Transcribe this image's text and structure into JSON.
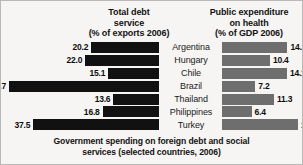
{
  "chart_data": {
    "type": "bar",
    "title": "Government spending on foreign debt and social services (selected countries, 2006)",
    "orientation": "horizontal",
    "layout": "diverging-paired",
    "grid": false,
    "legend": "none",
    "categories": [
      "Argentina",
      "Hungary",
      "Chile",
      "Brazil",
      "Thailand",
      "Philippines",
      "Turkey"
    ],
    "series": [
      {
        "name": "Total debt service (% of exports 2006)",
        "side": "left",
        "color": "#111111",
        "direction": "right-to-left",
        "values": [
          20.2,
          22.0,
          15.1,
          44.7,
          13.6,
          16.8,
          37.5
        ],
        "labels": [
          "20.2",
          "22.0",
          "15.1",
          "44.7",
          "13.6",
          "16.8",
          "37.5"
        ],
        "max": 44.7
      },
      {
        "name": "Public expenditure on health (% of GDP 2006)",
        "side": "right",
        "color": "#6e6e6e",
        "direction": "left-to-right",
        "values": [
          14.2,
          10.4,
          14.1,
          7.2,
          11.3,
          6.4,
          16.5
        ],
        "labels": [
          "14.2",
          "10.4",
          "14.1",
          "7.2",
          "11.3",
          "6.4",
          "16.5"
        ],
        "max": 16.5
      }
    ]
  },
  "headers": {
    "left": {
      "line1": "Total debt",
      "line2": "service",
      "line3": "(% of exports 2006)"
    },
    "right": {
      "line1": "Public expenditure",
      "line2": "on health",
      "line3": "(% of GDP 2006)"
    }
  },
  "rows": [
    {
      "country": "Argentina",
      "debt": "20.2",
      "debt_val": 20.2,
      "health": "14.2",
      "health_val": 14.2
    },
    {
      "country": "Hungary",
      "debt": "22.0",
      "debt_val": 22.0,
      "health": "10.4",
      "health_val": 10.4
    },
    {
      "country": "Chile",
      "debt": "15.1",
      "debt_val": 15.1,
      "health": "14.1",
      "health_val": 14.1
    },
    {
      "country": "Brazil",
      "debt": "44.7",
      "debt_val": 44.7,
      "health": "7.2",
      "health_val": 7.2
    },
    {
      "country": "Thailand",
      "debt": "13.6",
      "debt_val": 13.6,
      "health": "11.3",
      "health_val": 11.3
    },
    {
      "country": "Philippines",
      "debt": "16.8",
      "debt_val": 16.8,
      "health": "6.4",
      "health_val": 6.4
    },
    {
      "country": "Turkey",
      "debt": "37.5",
      "debt_val": 37.5,
      "health": "16.5",
      "health_val": 16.5
    }
  ],
  "caption": {
    "line1": "Government spending on foreign debt and social",
    "line2": "services (selected countries, 2006)"
  },
  "colors": {
    "debt_bar": "#111111",
    "health_bar": "#6e6e6e",
    "background": "#f6f5f3",
    "border": "#b9b9b7",
    "text": "#121212"
  }
}
